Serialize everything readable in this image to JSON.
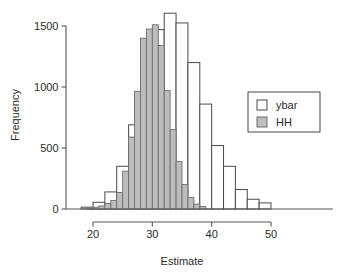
{
  "chart_data": {
    "type": "bar",
    "title": "",
    "subtitle": "",
    "xlabel": "Estimate",
    "ylabel": "Frequency",
    "xlim": [
      18,
      57
    ],
    "ylim": [
      0,
      1650
    ],
    "xticks": [
      20,
      30,
      40,
      50
    ],
    "xtick_labels": [
      "20",
      "30",
      "40",
      "50"
    ],
    "yticks": [
      0,
      500,
      1000,
      1500
    ],
    "ytick_labels": [
      "0",
      "500",
      "1000",
      "1500"
    ],
    "grid": false,
    "legend_position": "right",
    "legend": [
      {
        "name": "ybar",
        "swatch": "white"
      },
      {
        "name": "HH",
        "swatch": "gray"
      }
    ],
    "colors": {
      "ybar_fill": "#ffffff",
      "ybar_stroke": "#4a4a4a",
      "hh_fill": "#bdbdbd",
      "hh_stroke": "#6e6e6e",
      "axis": "#555555",
      "text": "#2b2b2b"
    },
    "series": [
      {
        "name": "ybar",
        "bin_width": 2,
        "bins": [
          {
            "x0": 18,
            "x1": 20,
            "value": 15
          },
          {
            "x0": 20,
            "x1": 22,
            "value": 55
          },
          {
            "x0": 22,
            "x1": 24,
            "value": 140
          },
          {
            "x0": 24,
            "x1": 26,
            "value": 350
          },
          {
            "x0": 26,
            "x1": 28,
            "value": 690
          },
          {
            "x0": 28,
            "x1": 30,
            "value": 970
          },
          {
            "x0": 30,
            "x1": 32,
            "value": 1470
          },
          {
            "x0": 32,
            "x1": 34,
            "value": 1605
          },
          {
            "x0": 34,
            "x1": 36,
            "value": 1525
          },
          {
            "x0": 36,
            "x1": 38,
            "value": 1200
          },
          {
            "x0": 38,
            "x1": 40,
            "value": 860
          },
          {
            "x0": 40,
            "x1": 42,
            "value": 520
          },
          {
            "x0": 42,
            "x1": 44,
            "value": 350
          },
          {
            "x0": 44,
            "x1": 46,
            "value": 160
          },
          {
            "x0": 46,
            "x1": 48,
            "value": 80
          },
          {
            "x0": 48,
            "x1": 50,
            "value": 50
          }
        ]
      },
      {
        "name": "HH",
        "bin_width": 1,
        "bins": [
          {
            "x0": 19,
            "x1": 20,
            "value": 10
          },
          {
            "x0": 20,
            "x1": 21,
            "value": 15
          },
          {
            "x0": 21,
            "x1": 22,
            "value": 25
          },
          {
            "x0": 22,
            "x1": 23,
            "value": 45
          },
          {
            "x0": 23,
            "x1": 24,
            "value": 70
          },
          {
            "x0": 24,
            "x1": 25,
            "value": 135
          },
          {
            "x0": 25,
            "x1": 26,
            "value": 310
          },
          {
            "x0": 26,
            "x1": 27,
            "value": 590
          },
          {
            "x0": 27,
            "x1": 28,
            "value": 965
          },
          {
            "x0": 28,
            "x1": 29,
            "value": 1400
          },
          {
            "x0": 29,
            "x1": 30,
            "value": 1475
          },
          {
            "x0": 30,
            "x1": 31,
            "value": 1510
          },
          {
            "x0": 31,
            "x1": 32,
            "value": 1340
          },
          {
            "x0": 32,
            "x1": 33,
            "value": 970
          },
          {
            "x0": 33,
            "x1": 34,
            "value": 650
          },
          {
            "x0": 34,
            "x1": 35,
            "value": 390
          },
          {
            "x0": 35,
            "x1": 36,
            "value": 200
          },
          {
            "x0": 36,
            "x1": 37,
            "value": 95
          },
          {
            "x0": 37,
            "x1": 38,
            "value": 40
          },
          {
            "x0": 38,
            "x1": 39,
            "value": 20
          }
        ]
      }
    ]
  }
}
